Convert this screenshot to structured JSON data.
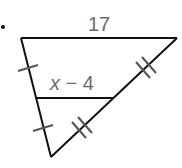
{
  "diagram": {
    "type": "triangle-midsegment",
    "bullet": "•",
    "labels": {
      "top_side": "17",
      "midsegment_var": "x",
      "midsegment_rest": " − 4"
    },
    "colors": {
      "line": "#111111",
      "label": "#6b6b6b",
      "tick": "#555555",
      "background": "#ffffff"
    },
    "vertices": {
      "top_left": [
        21,
        38
      ],
      "top_right": [
        177,
        38
      ],
      "bottom": [
        51,
        157
      ]
    },
    "midsegment": {
      "left": [
        36,
        98
      ],
      "right": [
        114,
        98
      ]
    },
    "tick_marks": {
      "left_side": "single",
      "right_side": "double"
    }
  }
}
